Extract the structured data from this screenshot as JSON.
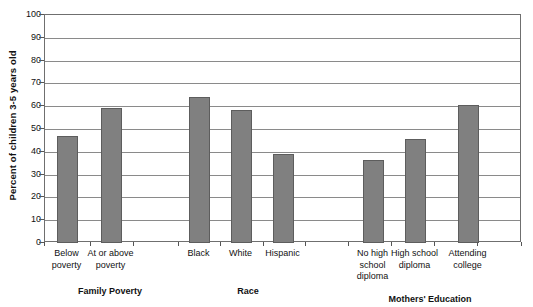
{
  "chart_data": {
    "type": "bar",
    "title": "",
    "xlabel": "",
    "ylabel": "Percent of children 3-5 years old",
    "ylim": [
      0,
      100
    ],
    "ytick_step": 10,
    "yticks": [
      "100",
      "90",
      "80",
      "70",
      "60",
      "50",
      "40",
      "30",
      "20",
      "10",
      "0"
    ],
    "grid": true,
    "legend": "none",
    "bar_color": "#808080",
    "bar_edge_color": "#5d5d5d",
    "categories": [
      "Below\npoverty",
      "At or above\npoverty",
      "Black",
      "White",
      "Hispanic",
      "No  high\nschool\ndiploma",
      "High school\ndiploma",
      "Attending\ncollege"
    ],
    "values": [
      47,
      59,
      64,
      58.5,
      39,
      36.5,
      45.5,
      60.5
    ],
    "groups": [
      {
        "label": "Family Poverty",
        "categories": [
          "Below\npoverty",
          "At or above\npoverty"
        ]
      },
      {
        "label": "Race",
        "categories": [
          "Black",
          "White",
          "Hispanic"
        ]
      },
      {
        "label": "Mothers' Education",
        "categories": [
          "No  high\nschool\ndiploma",
          "High school\ndiploma",
          "Attending\ncollege"
        ]
      }
    ]
  },
  "axis": {
    "y_title": "Percent of children 3-5 years old"
  },
  "group_labels": {
    "family_poverty": "Family Poverty",
    "race": "Race",
    "mothers_education": "Mothers' Education"
  }
}
